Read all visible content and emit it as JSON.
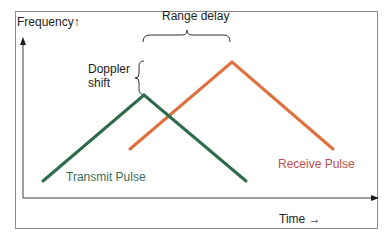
{
  "diagram": {
    "axes": {
      "y_label": "Frequency↑",
      "x_label": "Time →"
    },
    "annotations": {
      "range_delay": "Range delay",
      "doppler_shift": "Doppler shift"
    },
    "series": [
      {
        "name": "Transmit Pulse",
        "label": "Transmit Pulse",
        "color": "#2e6b4a",
        "shape": "triangle",
        "points": [
          [
            43,
            181
          ],
          [
            144,
            95
          ],
          [
            246,
            181
          ]
        ]
      },
      {
        "name": "Receive Pulse",
        "label": "Receive Pulse",
        "color": "#e0703e",
        "shape": "triangle",
        "points": [
          [
            130,
            149
          ],
          [
            232,
            62
          ],
          [
            333,
            149
          ]
        ]
      }
    ],
    "colors": {
      "frame": "#8a8a8a",
      "axis": "#3a3a3a",
      "text": "#222222",
      "transmit_text": "#3b6e55",
      "receive_text": "#c0504d"
    }
  }
}
